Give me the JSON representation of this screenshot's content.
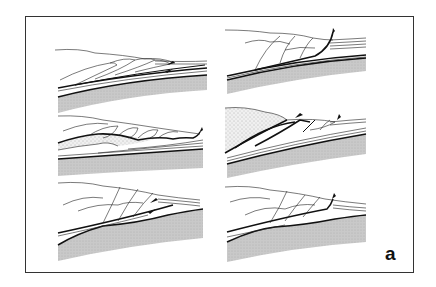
{
  "figure": {
    "label": "a",
    "layout": "3 rows x 2 columns",
    "colors": {
      "line": "#111111",
      "basement_fill": "#c8c8c8",
      "sediment_stipple": "#bbbbbb",
      "background": "#ffffff"
    },
    "panels": [
      {
        "id": "left-1",
        "position": "row 1, left",
        "symbol": "strike-slip / shear arrows",
        "stippled_sediment": false
      },
      {
        "id": "right-1",
        "position": "row 1, right",
        "symbol": "thrust arrow",
        "stippled_sediment": false
      },
      {
        "id": "left-2",
        "position": "row 2, left",
        "symbol": "thrust arrow",
        "stippled_sediment": true
      },
      {
        "id": "right-2",
        "position": "row 2, right",
        "symbol": "two thrust arrows",
        "stippled_sediment": true
      },
      {
        "id": "left-3",
        "position": "row 3, left",
        "symbol": "shear arrows",
        "stippled_sediment": false
      },
      {
        "id": "right-3",
        "position": "row 3, right",
        "symbol": "thrust arrow",
        "stippled_sediment": false
      }
    ]
  }
}
